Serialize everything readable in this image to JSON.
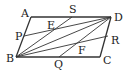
{
  "diagram": {
    "type": "geometry",
    "figure": "parallelogram",
    "colors": {
      "line": "#333333",
      "text": "#222222",
      "background": "#ffffff"
    },
    "points": {
      "A": {
        "label": "A",
        "x": 31,
        "y": 17,
        "lx": 21,
        "ly": 17
      },
      "D": {
        "label": "D",
        "x": 111,
        "y": 17,
        "lx": 114,
        "ly": 21
      },
      "B": {
        "label": "B",
        "x": 16,
        "y": 57,
        "lx": 6,
        "ly": 62
      },
      "C": {
        "label": "C",
        "x": 100,
        "y": 57,
        "lx": 103,
        "ly": 64
      },
      "P": {
        "label": "P",
        "x": 24,
        "y": 36,
        "lx": 15,
        "ly": 40
      },
      "S": {
        "label": "S",
        "x": 72,
        "y": 17,
        "lx": 69,
        "ly": 13
      },
      "R": {
        "label": "R",
        "x": 108,
        "y": 36,
        "lx": 111,
        "ly": 44
      },
      "Q": {
        "label": "Q",
        "x": 59,
        "y": 57,
        "lx": 54,
        "ly": 68
      },
      "E": {
        "label": "E",
        "x": 52,
        "y": 30,
        "lx": 47,
        "ly": 29
      },
      "F": {
        "label": "F",
        "x": 79,
        "y": 43,
        "lx": 78,
        "ly": 54
      }
    },
    "segments": [
      [
        "A",
        "D"
      ],
      [
        "D",
        "C"
      ],
      [
        "C",
        "B"
      ],
      [
        "B",
        "A"
      ],
      [
        "P",
        "D"
      ],
      [
        "B",
        "S"
      ],
      [
        "B",
        "D"
      ],
      [
        "B",
        "R"
      ],
      [
        "Q",
        "D"
      ]
    ]
  }
}
